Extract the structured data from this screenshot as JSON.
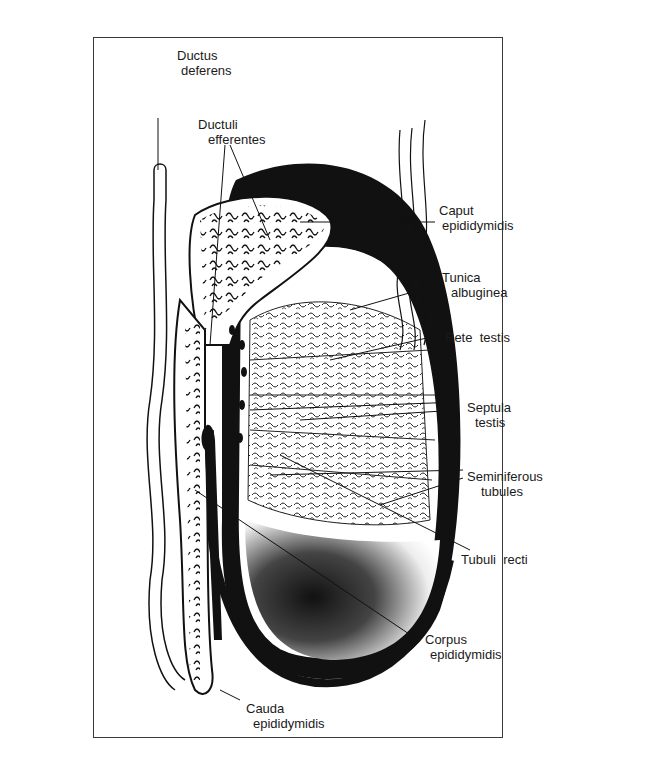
{
  "figure": {
    "type": "anatomical-illustration"
  },
  "labels": {
    "ductus_deferens": {
      "line1": "Ductus",
      "line2": "deferens"
    },
    "ductuli_efferentes": {
      "line1": "Ductuli",
      "line2": "efferentes"
    },
    "caput_epididymidis": {
      "line1": "Caput",
      "line2": "epididymidis"
    },
    "tunica_albuginea": {
      "line1": "Tunica",
      "line2": "albuginea"
    },
    "rete_testis": {
      "line1": "Rete  testis"
    },
    "septula_testis": {
      "line1": "Septula",
      "line2": "testis"
    },
    "seminiferous_tubules": {
      "line1": "Seminiferous",
      "line2": "tubules"
    },
    "tubuli_recti": {
      "line1": "Tubuli  recti"
    },
    "corpus_epididymidis": {
      "line1": "Corpus",
      "line2": "epididymidis"
    },
    "cauda_epididymidis": {
      "line1": "Cauda",
      "line2": "epididymidis"
    }
  },
  "colors": {
    "ink": "#111111",
    "paper": "#ffffff",
    "frame": "#3a3a3a"
  }
}
